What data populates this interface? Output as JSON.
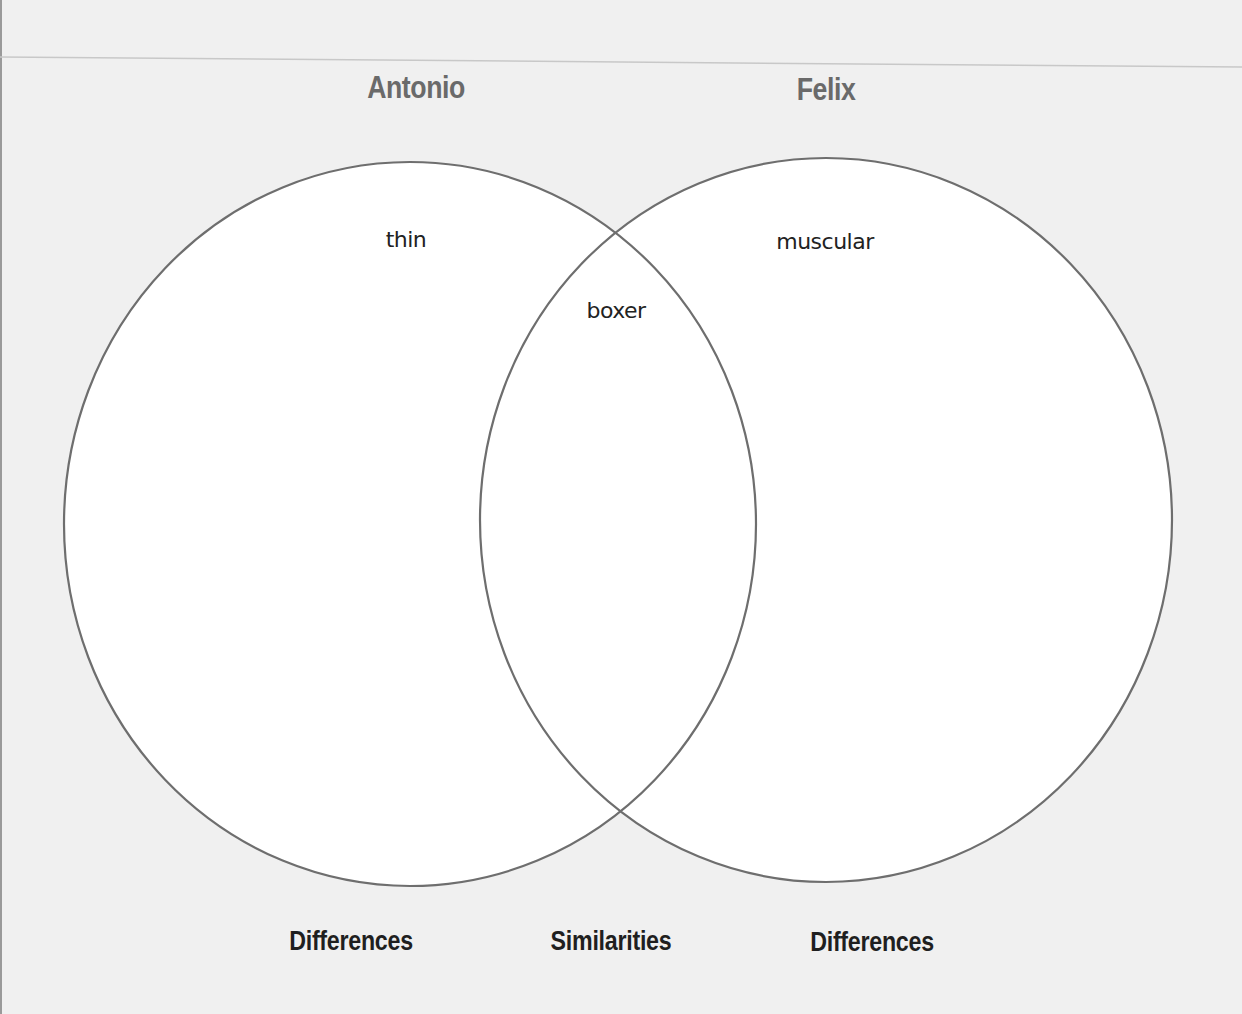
{
  "diagram": {
    "type": "venn",
    "sets": [
      {
        "name": "Antonio",
        "differences": [
          "thin"
        ]
      },
      {
        "name": "Felix",
        "differences": [
          "muscular"
        ]
      }
    ],
    "similarities": [
      "boxer"
    ],
    "bottom_labels": {
      "left": "Differences",
      "center": "Similarities",
      "right": "Differences"
    },
    "colors": {
      "background": "#f0f0f0",
      "circle_fill": "#ffffff",
      "circle_stroke": "#6e6e6e",
      "title_text": "#6a6a6a",
      "label_text": "#1f1f1f"
    }
  }
}
